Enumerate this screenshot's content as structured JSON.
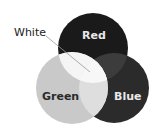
{
  "diagram": {
    "type": "venn",
    "circles": [
      {
        "name": "red",
        "label": "Red",
        "fill": "#1a1a1a",
        "label_color": "#e8e8e8"
      },
      {
        "name": "green",
        "label": "Green",
        "fill": "#c8c8c8",
        "label_color": "#2a2a2a"
      },
      {
        "name": "blue",
        "label": "Blue",
        "fill": "#2a2a2a",
        "label_color": "#e8e8e8"
      }
    ],
    "overlaps": {
      "red_green": "#f4f4f4",
      "red_blue": "#3a3a3a",
      "green_blue": "#dcdcdc",
      "center": "#f8f8f8"
    },
    "callout": {
      "label": "White",
      "color": "#222222"
    }
  }
}
